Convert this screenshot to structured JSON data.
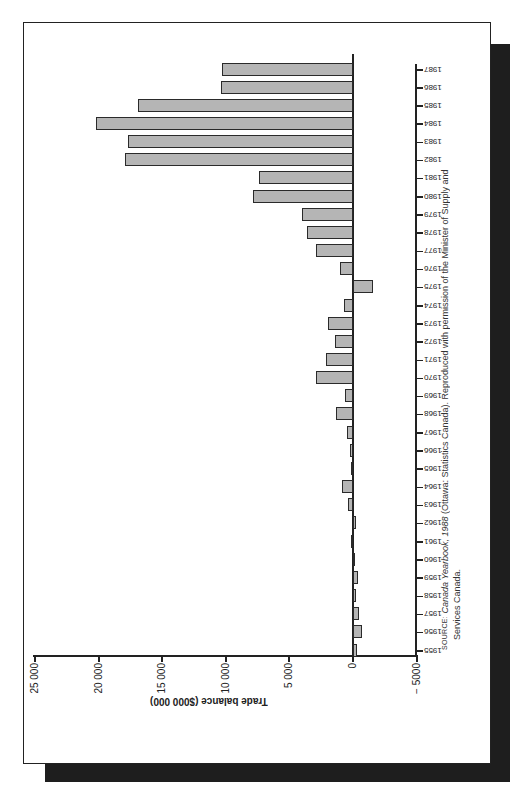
{
  "chart_data": {
    "type": "bar",
    "orientation": "horizontal",
    "rotation_deg": 180,
    "title": "",
    "xlabel": "",
    "ylabel": "Trade balance ($000 000)",
    "value_axis": {
      "ticks": [
        25000,
        20000,
        15000,
        10000,
        5000,
        0,
        -5000
      ],
      "tick_labels": [
        "25 000",
        "20 000",
        "15 000",
        "10 000",
        "5 000",
        "0",
        "− 5000"
      ],
      "range": [
        -5000,
        25000
      ]
    },
    "categories": [
      "1955",
      "1956",
      "1957",
      "1958",
      "1959",
      "1960",
      "1961",
      "1962",
      "1963",
      "1964",
      "1965",
      "1966",
      "1967",
      "1968",
      "1969",
      "1970",
      "1971",
      "1972",
      "1973",
      "1974",
      "1975",
      "1976",
      "1977",
      "1978",
      "1979",
      "1980",
      "1981",
      "1982",
      "1983",
      "1984",
      "1985",
      "1986",
      "1987"
    ],
    "values": [
      -300,
      -700,
      -500,
      -200,
      -400,
      -100,
      100,
      -200,
      400,
      900,
      100,
      200,
      500,
      1300,
      600,
      2900,
      2100,
      1400,
      2000,
      700,
      -1600,
      1000,
      2900,
      3600,
      4000,
      7900,
      7400,
      17900,
      17700,
      20200,
      16900,
      10400,
      10300
    ],
    "grid": false,
    "legend": null,
    "bar_color": "#b5b5b5"
  },
  "source": {
    "prefix": "SOURCE:",
    "book": "Canada Yearbook, 1988",
    "line1_rest": " (Ottawa: Statistics Canada). Reproduced with permission of the Minister of Supply and",
    "line2": "Services Canada."
  }
}
